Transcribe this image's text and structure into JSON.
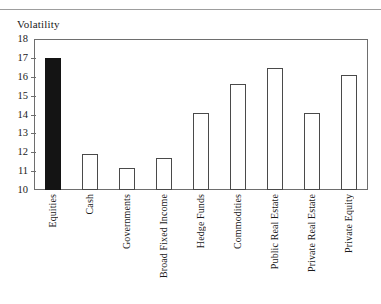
{
  "chart_title": "Volatility",
  "axis": {
    "y_ticks": [
      "18",
      "17",
      "16",
      "15",
      "14",
      "13",
      "12",
      "11",
      "10"
    ]
  },
  "chart_data": {
    "type": "bar",
    "title": "Volatility",
    "xlabel": "",
    "ylabel": "Volatility",
    "ylim": [
      10,
      18
    ],
    "ytick_values": [
      10,
      11,
      12,
      13,
      14,
      15,
      16,
      17,
      18
    ],
    "grid": false,
    "legend": "none",
    "bar_colors": {
      "highlight": "#141414",
      "default_fill": "#ffffff",
      "default_edge": "#4a4a4a"
    },
    "categories": [
      "Equities",
      "Cash",
      "Governments",
      "Broad Fixed Income",
      "Hedge Funds",
      "Commodities",
      "Public Real Estate",
      "Private Real Estate",
      "Private Equity"
    ],
    "values": [
      17.0,
      11.9,
      11.15,
      11.7,
      14.1,
      15.6,
      16.45,
      14.1,
      16.1
    ],
    "highlighted_category": "Equities"
  },
  "bars": [
    {
      "label": "Equities",
      "value": 17.0,
      "style": "filled"
    },
    {
      "label": "Cash",
      "value": 11.9,
      "style": "outline"
    },
    {
      "label": "Governments",
      "value": 11.15,
      "style": "outline"
    },
    {
      "label": "Broad Fixed Income",
      "value": 11.7,
      "style": "outline"
    },
    {
      "label": "Hedge Funds",
      "value": 14.1,
      "style": "outline"
    },
    {
      "label": "Commodities",
      "value": 15.6,
      "style": "outline"
    },
    {
      "label": "Public Real Estate",
      "value": 16.45,
      "style": "outline"
    },
    {
      "label": "Private Real Estate",
      "value": 14.1,
      "style": "outline"
    },
    {
      "label": "Private Equity",
      "value": 16.1,
      "style": "outline"
    }
  ]
}
